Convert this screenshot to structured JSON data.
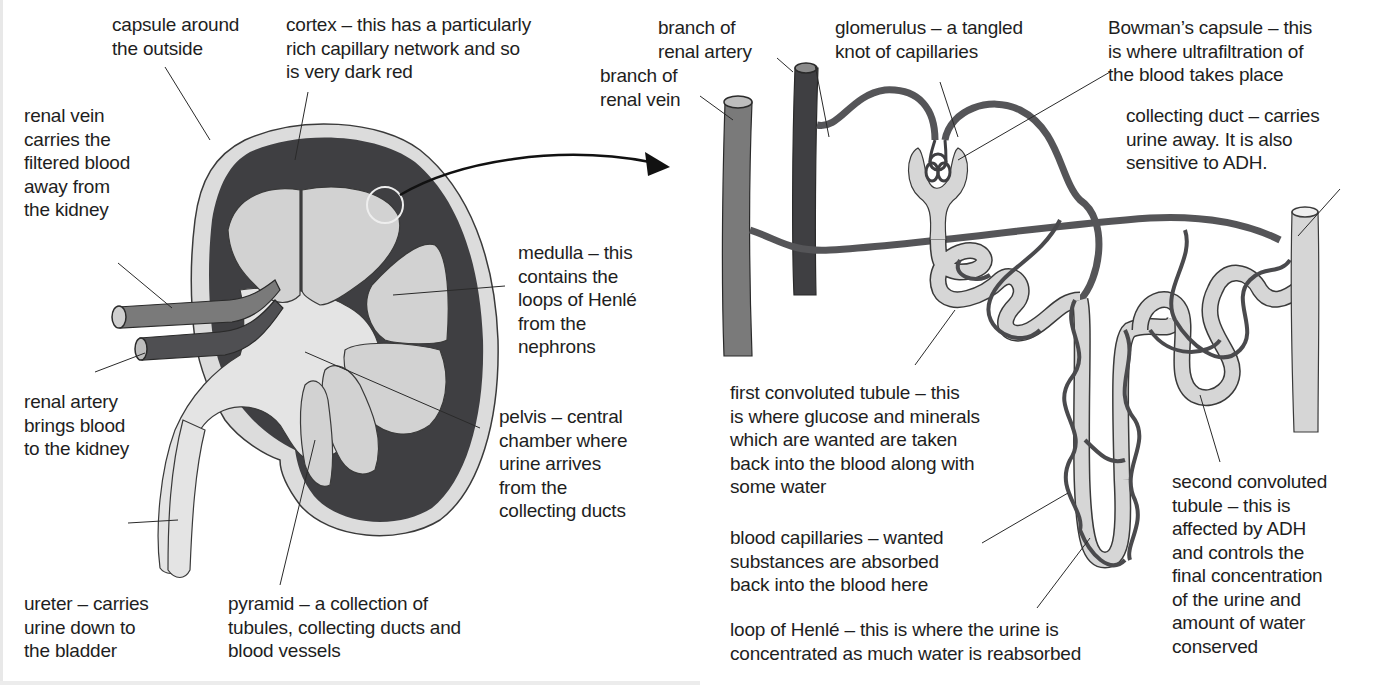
{
  "figure": {
    "panels": [
      {
        "id": "kidney",
        "title": "Kidney cross-section"
      },
      {
        "id": "nephron",
        "title": "Nephron"
      }
    ],
    "colors": {
      "cortex_dark_red": "#3f3f42",
      "capsule_pale": "#dcdcdc",
      "pyramid_light": "#d2d2d2",
      "pelvis_light": "#e4e4e4",
      "renal_vein": "#7a7a7a",
      "renal_artery": "#4f4f52",
      "tubule": "#d6d6d6",
      "capillary": "#555558",
      "outline": "#2a2a2a"
    }
  },
  "kidney_labels": {
    "capsule": "capsule around\nthe outside",
    "cortex": "cortex – this has a particularly\nrich capillary network and so\nis very dark red",
    "renal_vein": "renal vein\ncarries the\nfiltered blood\naway from\nthe kidney",
    "medulla": "medulla – this\ncontains the\nloops of Henlé\nfrom the\nnephrons",
    "renal_artery": "renal artery\nbrings blood\nto the kidney",
    "pelvis": "pelvis – central\nchamber where\nurine arrives\nfrom the\ncollecting ducts",
    "ureter": "ureter – carries\nurine down to\nthe bladder",
    "pyramid": "pyramid – a collection of\ntubules, collecting ducts and\nblood vessels"
  },
  "nephron_labels": {
    "branch_renal_artery": "branch of\nrenal artery",
    "branch_renal_vein": "branch of\nrenal vein",
    "glomerulus": "glomerulus – a tangled\nknot of capillaries",
    "bowmans_capsule": "Bowman’s capsule – this\nis where ultrafiltration of\nthe blood takes place",
    "collecting_duct": "collecting duct – carries\nurine away. It is also\nsensitive to ADH.",
    "first_convoluted_tubule": "first convoluted tubule – this\nis where glucose and minerals\nwhich are wanted are taken\nback into the blood along with\nsome water",
    "blood_capillaries": "blood capillaries – wanted\nsubstances are absorbed\nback into the blood here",
    "loop_of_henle": "loop of Henlé – this is where the urine is\nconcentrated as much water is reabsorbed",
    "second_convoluted_tubule": "second convoluted\ntubule – this is\naffected by ADH\nand controls the\nfinal concentration\nof the urine and\namount of water\nconserved"
  }
}
